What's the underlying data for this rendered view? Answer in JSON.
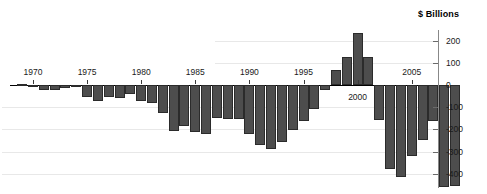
{
  "chart_data": {
    "type": "bar",
    "title": "",
    "subtitle": "",
    "axis_title": "$ Billions",
    "xlabel": "",
    "ylabel": "$ Billions",
    "ylim": [
      -450,
      260
    ],
    "yticks": [
      200,
      100,
      0,
      -100,
      -200,
      -300,
      -400
    ],
    "ytick_labels": [
      "200",
      "100",
      "0",
      "-100",
      "-200",
      "-300",
      "-400"
    ],
    "xticks": [
      1970,
      1975,
      1980,
      1985,
      1990,
      1995,
      2000,
      2005
    ],
    "xtick_labels": [
      "1970",
      "1975",
      "1980",
      "1985",
      "1990",
      "1995",
      "2000",
      "2005"
    ],
    "grid": true,
    "legend": null,
    "bar_color": "#4d4d4d",
    "bar_edge_color": "#2b2b2b",
    "gridline_color": "#e8e8e8",
    "axis_color": "#888888",
    "categories": [
      "1969",
      "1970",
      "1971",
      "1972",
      "1973",
      "1974",
      "1975",
      "1976",
      "1977",
      "1978",
      "1979",
      "1980",
      "1981",
      "1982",
      "1983",
      "1984",
      "1985",
      "1986",
      "1987",
      "1988",
      "1989",
      "1990",
      "1991",
      "1992",
      "1993",
      "1994",
      "1995",
      "1996",
      "1997",
      "1998",
      "1999",
      "2000",
      "2001",
      "2002",
      "2003",
      "2004",
      "2005",
      "2006",
      "2007",
      "2008",
      "2009"
    ],
    "values": [
      3,
      -3,
      -23,
      -23,
      -15,
      -6,
      -53,
      -74,
      -54,
      -59,
      -41,
      -74,
      -79,
      -128,
      -208,
      -185,
      -212,
      -221,
      -150,
      -155,
      -153,
      -221,
      -269,
      -290,
      -255,
      -203,
      -164,
      -107,
      -22,
      69,
      125,
      236,
      128,
      -158,
      -378,
      -413,
      -318,
      -248,
      -161,
      -459,
      -455
    ]
  }
}
